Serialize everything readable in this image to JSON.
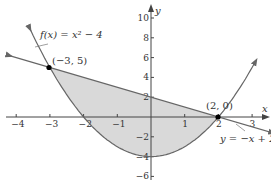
{
  "chart_data": {
    "type": "line",
    "title": "",
    "xlabel": "x",
    "ylabel": "y",
    "xlim": [
      -4.3,
      3.7
    ],
    "ylim": [
      -6.5,
      10.8
    ],
    "x_ticks": [
      -4,
      -3,
      -2,
      -1,
      1,
      2,
      3
    ],
    "y_ticks": [
      10,
      8,
      6,
      4,
      2,
      -2,
      -4,
      -6
    ],
    "grid": false,
    "series": [
      {
        "name": "f(x) = x² − 4",
        "type": "parabola",
        "equation": "y = x^2 - 4",
        "points": [
          [
            -3.6,
            8.96
          ],
          [
            -3,
            5
          ],
          [
            -2,
            0
          ],
          [
            -1,
            -3
          ],
          [
            0,
            -4
          ],
          [
            1,
            -3
          ],
          [
            2,
            0
          ],
          [
            3,
            5
          ],
          [
            3.1,
            5.61
          ]
        ]
      },
      {
        "name": "y = −x + 2",
        "type": "line",
        "equation": "y = -x + 2",
        "points": [
          [
            -4.2,
            6.2
          ],
          [
            3.6,
            -1.6
          ]
        ]
      }
    ],
    "shaded_region": {
      "between": [
        "y = -x + 2",
        "y = x^2 - 4"
      ],
      "x_range": [
        -3,
        2
      ],
      "color": "#d9d9d9"
    },
    "annotations": [
      {
        "text": "(−3, 5)",
        "x": -3,
        "y": 5,
        "marker": "dot"
      },
      {
        "text": "(2, 0)",
        "x": 2,
        "y": 0,
        "marker": "dot"
      },
      {
        "text": "f(x) = x² − 4",
        "target": "parabola"
      },
      {
        "text": "y = −x + 2",
        "target": "line"
      }
    ]
  },
  "labels": {
    "x_axis": "x",
    "y_axis": "y",
    "point_a": "(−3, 5)",
    "point_b": "(2, 0)",
    "parabola_label": "f(x) = x² − 4",
    "line_label": "y = −x + 2",
    "x_ticks": [
      "−4",
      "−3",
      "−2",
      "−1",
      "1",
      "2",
      "3"
    ],
    "y_ticks": [
      "10",
      "8",
      "6",
      "4",
      "2",
      "−2",
      "−4",
      "−6"
    ]
  },
  "colors": {
    "curve": "#666666",
    "axis": "#444444",
    "shade": "#d9d9d9",
    "point": "#000000"
  }
}
